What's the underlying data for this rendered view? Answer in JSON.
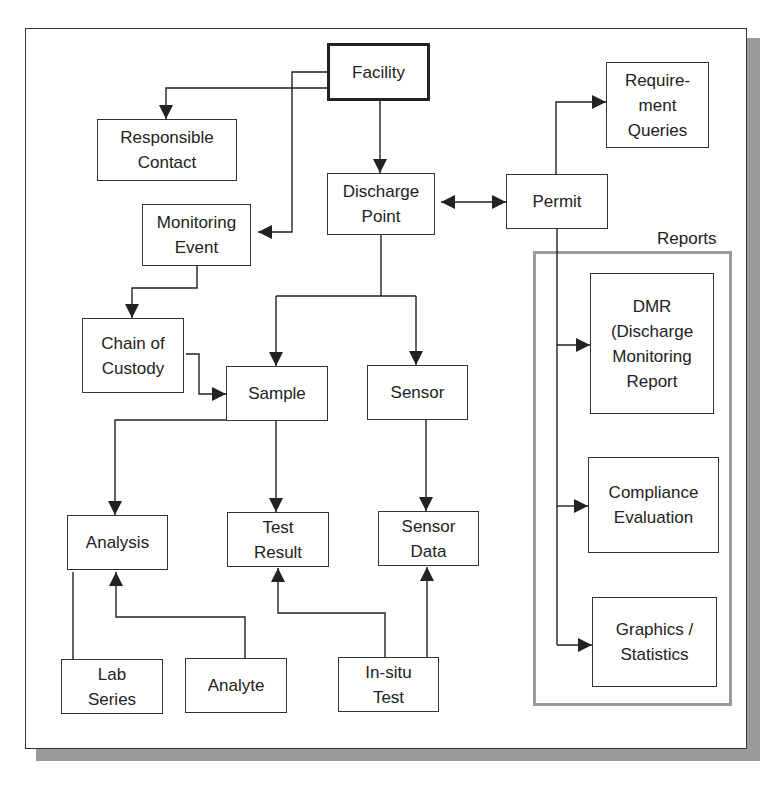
{
  "diagram": {
    "type": "entity-relationship flow diagram",
    "colors": {
      "line": "#222222",
      "frame_shadow": "#9a9a9a",
      "group_border": "#9a9a9a",
      "background": "#ffffff"
    },
    "group": {
      "id": "reports",
      "label": "Reports"
    },
    "nodes": [
      {
        "id": "facility",
        "label": "Facility",
        "primary": true
      },
      {
        "id": "responsible_contact",
        "label": "Responsible\nContact"
      },
      {
        "id": "discharge_point",
        "label": "Discharge\nPoint"
      },
      {
        "id": "permit",
        "label": "Permit"
      },
      {
        "id": "requirement_queries",
        "label": "Require-\nment\nQueries"
      },
      {
        "id": "monitoring_event",
        "label": "Monitoring\nEvent"
      },
      {
        "id": "chain_of_custody",
        "label": "Chain of\nCustody"
      },
      {
        "id": "sample",
        "label": "Sample"
      },
      {
        "id": "sensor",
        "label": "Sensor"
      },
      {
        "id": "dmr",
        "label": "DMR\n(Discharge\nMonitoring\nReport"
      },
      {
        "id": "compliance_evaluation",
        "label": "Compliance\nEvaluation"
      },
      {
        "id": "graphics_statistics",
        "label": "Graphics /\nStatistics"
      },
      {
        "id": "analysis",
        "label": "Analysis"
      },
      {
        "id": "test_result",
        "label": "Test\nResult"
      },
      {
        "id": "sensor_data",
        "label": "Sensor\nData"
      },
      {
        "id": "lab_series",
        "label": "Lab\nSeries"
      },
      {
        "id": "analyte",
        "label": "Analyte"
      },
      {
        "id": "in_situ_test",
        "label": "In-situ\nTest"
      }
    ],
    "edges": [
      {
        "from": "facility",
        "to": "responsible_contact",
        "arrow": "end"
      },
      {
        "from": "facility",
        "to": "monitoring_event",
        "arrow": "end"
      },
      {
        "from": "facility",
        "to": "discharge_point",
        "arrow": "end"
      },
      {
        "from": "discharge_point",
        "to": "permit",
        "arrow": "both"
      },
      {
        "from": "permit",
        "to": "requirement_queries",
        "arrow": "end"
      },
      {
        "from": "permit",
        "to": "dmr",
        "arrow": "end"
      },
      {
        "from": "permit",
        "to": "compliance_evaluation",
        "arrow": "end"
      },
      {
        "from": "permit",
        "to": "graphics_statistics",
        "arrow": "end"
      },
      {
        "from": "monitoring_event",
        "to": "chain_of_custody",
        "arrow": "end"
      },
      {
        "from": "chain_of_custody",
        "to": "sample",
        "arrow": "end"
      },
      {
        "from": "discharge_point",
        "to": "sample",
        "arrow": "end"
      },
      {
        "from": "discharge_point",
        "to": "sensor",
        "arrow": "end"
      },
      {
        "from": "sample",
        "to": "analysis",
        "arrow": "end"
      },
      {
        "from": "sample",
        "to": "test_result",
        "arrow": "end"
      },
      {
        "from": "sensor",
        "to": "sensor_data",
        "arrow": "end"
      },
      {
        "from": "analyte",
        "to": "analysis",
        "arrow": "end"
      },
      {
        "from": "lab_series",
        "to": "analysis",
        "arrow": "none"
      },
      {
        "from": "in_situ_test",
        "to": "test_result",
        "arrow": "end"
      },
      {
        "from": "in_situ_test",
        "to": "sensor_data",
        "arrow": "end"
      }
    ]
  }
}
